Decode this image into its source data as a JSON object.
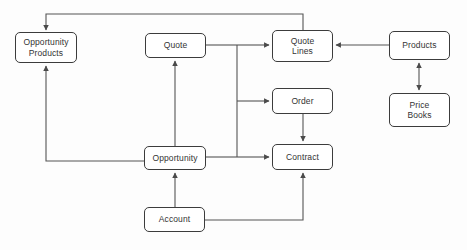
{
  "diagram": {
    "type": "flow-diagram",
    "style": {
      "background_color": "#fdfdfd",
      "node_fill": "#ffffff",
      "node_border": "#3c3c3c",
      "text_color": "#333333",
      "connector_color": "#555555"
    },
    "nodes": [
      {
        "id": "opportunity-products",
        "label": "Opportunity\nProducts",
        "x": 15,
        "y": 32,
        "w": 62,
        "h": 31
      },
      {
        "id": "quote",
        "label": "Quote",
        "x": 145,
        "y": 33,
        "w": 61,
        "h": 25
      },
      {
        "id": "quote-lines",
        "label": "Quote\nLines",
        "x": 272,
        "y": 30,
        "w": 61,
        "h": 32
      },
      {
        "id": "products",
        "label": "Products",
        "x": 389,
        "y": 31,
        "w": 61,
        "h": 29
      },
      {
        "id": "price-books",
        "label": "Price\nBooks",
        "x": 389,
        "y": 93,
        "w": 61,
        "h": 34
      },
      {
        "id": "order",
        "label": "Order",
        "x": 272,
        "y": 88,
        "w": 61,
        "h": 26
      },
      {
        "id": "contract",
        "label": "Contract",
        "x": 272,
        "y": 144,
        "w": 61,
        "h": 26
      },
      {
        "id": "opportunity",
        "label": "Opportunity",
        "x": 144,
        "y": 146,
        "w": 62,
        "h": 24
      },
      {
        "id": "account",
        "label": "Account",
        "x": 144,
        "y": 207,
        "w": 61,
        "h": 25
      }
    ],
    "connectors": [
      {
        "id": "quote-lines-to-opportunity-products",
        "from": "quote-lines",
        "to": "opportunity-products",
        "arrows": "end",
        "route": "orthogonal-top"
      },
      {
        "id": "quote-to-quote-lines",
        "from": "quote",
        "to": "quote-lines",
        "arrows": "end",
        "route": "trunk-right"
      },
      {
        "id": "products-to-quote-lines",
        "from": "products",
        "to": "quote-lines",
        "arrows": "end",
        "route": "horizontal"
      },
      {
        "id": "products-to-price-books",
        "from": "products",
        "to": "price-books",
        "arrows": "both",
        "route": "vertical"
      },
      {
        "id": "trunk-to-order",
        "from": "quote",
        "to": "order",
        "arrows": "end",
        "route": "trunk-right"
      },
      {
        "id": "order-to-contract",
        "from": "order",
        "to": "contract",
        "arrows": "end",
        "route": "vertical"
      },
      {
        "id": "opportunity-to-contract",
        "from": "opportunity",
        "to": "contract",
        "arrows": "end",
        "route": "horizontal"
      },
      {
        "id": "opportunity-to-quote",
        "from": "opportunity",
        "to": "quote",
        "arrows": "end",
        "route": "vertical"
      },
      {
        "id": "opportunity-to-opportunity-products",
        "from": "opportunity",
        "to": "opportunity-products",
        "arrows": "end",
        "route": "orthogonal-left"
      },
      {
        "id": "account-to-opportunity",
        "from": "account",
        "to": "opportunity",
        "arrows": "end",
        "route": "vertical"
      },
      {
        "id": "account-to-contract",
        "from": "account",
        "to": "contract",
        "arrows": "end",
        "route": "orthogonal-right"
      }
    ]
  }
}
